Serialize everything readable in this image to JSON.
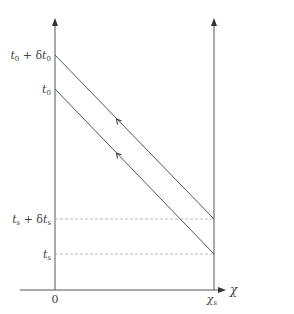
{
  "diagram": {
    "axes": {
      "x_label": "χ",
      "x_origin_label": "0",
      "x_marker_label": "χ",
      "x_marker_sub": "s"
    },
    "y_labels": {
      "t0_delta": {
        "t": "t",
        "sub": "0",
        "plus": " + δ",
        "t2": "t",
        "sub2": "0"
      },
      "t0": {
        "t": "t",
        "sub": "0"
      },
      "ts_delta": {
        "t": "t",
        "sub": "s",
        "plus": " + δ",
        "t2": "t",
        "sub2": "s"
      },
      "ts": {
        "t": "t",
        "sub": "s"
      }
    },
    "colors": {
      "axis": "#555555",
      "line": "#555555",
      "dashed": "#aaaaaa",
      "text": "#444444"
    }
  }
}
